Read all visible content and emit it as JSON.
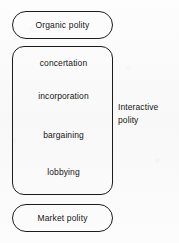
{
  "diagram": {
    "background_color": "#fbfbfb",
    "stroke_color": "#1c1c1c",
    "text_color": "#141414",
    "top_node": {
      "label": "Organic polity",
      "shape": "pill"
    },
    "bottom_node": {
      "label": "Market polity",
      "shape": "pill"
    },
    "center_box": {
      "shape": "rounded-rectangle",
      "items": [
        {
          "label": "concertation"
        },
        {
          "label": "incorporation"
        },
        {
          "label": "bargaining"
        },
        {
          "label": "lobbying"
        }
      ]
    },
    "side_caption": {
      "line1": "Interactive",
      "line2": "polity"
    }
  }
}
